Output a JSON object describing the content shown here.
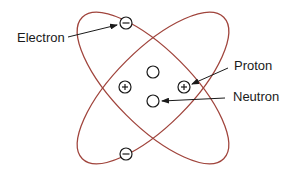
{
  "diagram": {
    "type": "atom-model",
    "labels": {
      "electron": "Electron",
      "proton": "Proton",
      "neutron": "Neutron"
    },
    "particles": {
      "electrons": 2,
      "protons": 2,
      "neutrons": 2
    },
    "colors": {
      "orbit": "#a0443c",
      "particle": "#1a1a1a"
    }
  }
}
